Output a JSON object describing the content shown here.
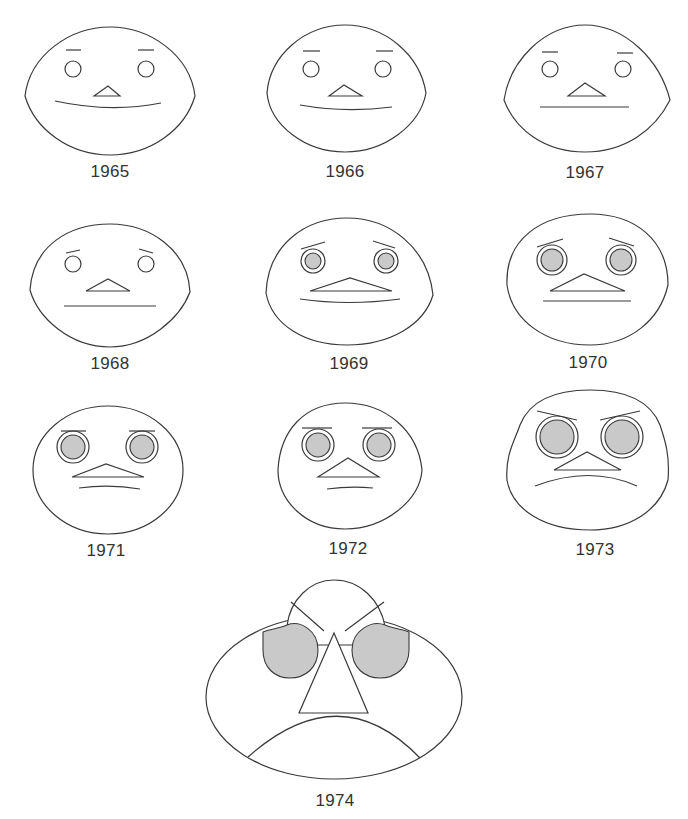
{
  "figure": {
    "type": "chernoff-faces",
    "shading_color": "#c9c9c9",
    "stroke_color": "#3a3a3a",
    "faces": [
      {
        "label": "1965",
        "expression": "smile",
        "eyes": "small-open",
        "brows": "flat"
      },
      {
        "label": "1966",
        "expression": "smile",
        "eyes": "small-open",
        "brows": "flat"
      },
      {
        "label": "1967",
        "expression": "neutral",
        "eyes": "small-open",
        "brows": "flat"
      },
      {
        "label": "1968",
        "expression": "neutral",
        "eyes": "small-open",
        "brows": "slightly-worried"
      },
      {
        "label": "1969",
        "expression": "slight-smile",
        "eyes": "shaded-ringed",
        "brows": "worried"
      },
      {
        "label": "1970",
        "expression": "neutral",
        "eyes": "shaded-ringed",
        "brows": "worried"
      },
      {
        "label": "1971",
        "expression": "slight-frown",
        "eyes": "shaded-ringed-large",
        "brows": "flat"
      },
      {
        "label": "1972",
        "expression": "slight-frown",
        "eyes": "shaded-ringed-large",
        "brows": "flat"
      },
      {
        "label": "1973",
        "expression": "frown",
        "eyes": "shaded-ringed-larger",
        "brows": "angry"
      },
      {
        "label": "1974",
        "expression": "deep-frown",
        "eyes": "shaded-huge",
        "brows": "angry"
      }
    ]
  }
}
